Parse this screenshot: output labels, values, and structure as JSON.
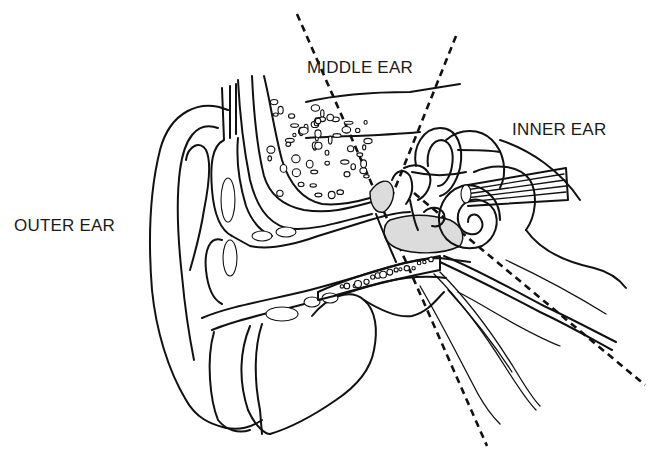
{
  "figure": {
    "labels": {
      "outer": "OUTER EAR",
      "middle": "MIDDLE EAR",
      "inner": "INNER EAR"
    },
    "dividers": [
      {
        "name": "outer-middle-boundary",
        "style": "dashed"
      },
      {
        "name": "middle-inner-boundary",
        "style": "dashed"
      },
      {
        "name": "inner-boundary",
        "style": "dashed"
      }
    ],
    "colors": {
      "ink": "#111111",
      "shade": "#dcdcdc",
      "background": "#ffffff"
    }
  }
}
